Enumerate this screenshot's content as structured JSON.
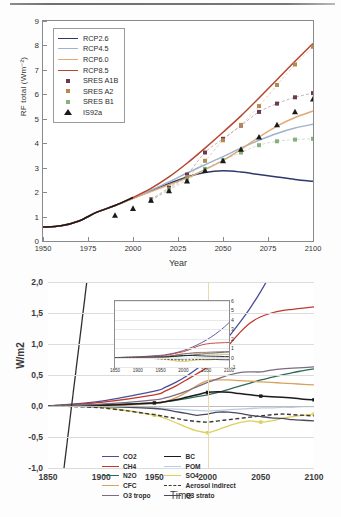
{
  "figure_top": {
    "ylabel": "RF total (Wm⁻²)",
    "xlabel": "Year",
    "yticks": [
      "0",
      "1",
      "2",
      "3",
      "4",
      "5",
      "6",
      "7",
      "8",
      "9"
    ],
    "xticks": [
      "1950",
      "1975",
      "2000",
      "2025",
      "2050",
      "2075",
      "2100"
    ],
    "legend": [
      {
        "label": "RCP2.6",
        "color": "#2b3a6b",
        "type": "line"
      },
      {
        "label": "RCP4.5",
        "color": "#9fb4cc",
        "type": "line"
      },
      {
        "label": "RCP6.0",
        "color": "#e2a878",
        "type": "line"
      },
      {
        "label": "RCP8.5",
        "color": "#b4462f",
        "type": "line"
      },
      {
        "label": "SRES A1B",
        "color": "#6b3a4e",
        "type": "square"
      },
      {
        "label": "SRES A2",
        "color": "#b58a4f",
        "type": "square"
      },
      {
        "label": "SRES B1",
        "color": "#86b07e",
        "type": "square"
      },
      {
        "label": "IS92a",
        "color": "#1a1a1a",
        "type": "triangle"
      }
    ]
  },
  "figure_bottom": {
    "ylabel": "W/m2",
    "xlabel": "Time",
    "yticks": [
      "2,0",
      "1,5",
      "1,0",
      "0,5",
      "0,0",
      "-0,5",
      "-1,0"
    ],
    "xticks": [
      "1850",
      "1900",
      "1950",
      "2000",
      "2050",
      "2100"
    ],
    "inset": {
      "yticks": [
        "6",
        "5",
        "4",
        "3",
        "2",
        "1",
        "0",
        "-1"
      ],
      "xticks": [
        "1850",
        "1900",
        "1950",
        "2000",
        "2050",
        "2100"
      ]
    },
    "legend_left": [
      {
        "label": "CO2",
        "color": "#4a4f9a",
        "style": "solid"
      },
      {
        "label": "CH4",
        "color": "#c0392b",
        "style": "solid"
      },
      {
        "label": "N2O",
        "color": "#2f6b53",
        "style": "solid"
      },
      {
        "label": "CFC",
        "color": "#d9a15f",
        "style": "solid"
      },
      {
        "label": "O3 tropo",
        "color": "#7d6b85",
        "style": "solid"
      }
    ],
    "legend_right": [
      {
        "label": "BC",
        "color": "#1a1a1a",
        "style": "solid-marker"
      },
      {
        "label": "POM",
        "color": "#b9cde2",
        "style": "solid"
      },
      {
        "label": "SO4",
        "color": "#ddd05a",
        "style": "solid-marker"
      },
      {
        "label": "Aerosol indirect",
        "color": "#3a3a3a",
        "style": "dashed"
      },
      {
        "label": "O3 strato",
        "color": "#4a4a5e",
        "style": "solid"
      }
    ]
  },
  "chart_data": [
    {
      "type": "line",
      "id": "rf-total-scenarios",
      "title": "",
      "xlabel": "Year",
      "ylabel": "RF total (Wm-2)",
      "xlim": [
        1950,
        2100
      ],
      "ylim": [
        0,
        9
      ],
      "grid": false,
      "legend_position": "upper-left",
      "x": [
        1950,
        1960,
        1970,
        1980,
        1990,
        2000,
        2010,
        2020,
        2030,
        2040,
        2050,
        2060,
        2070,
        2080,
        2090,
        2100
      ],
      "series": [
        {
          "name": "RCP2.6",
          "color": "#2b3a6b",
          "values": [
            0.57,
            0.62,
            0.82,
            1.18,
            1.45,
            1.75,
            2.05,
            2.35,
            2.62,
            2.8,
            2.87,
            2.82,
            2.72,
            2.62,
            2.52,
            2.44
          ]
        },
        {
          "name": "RCP4.5",
          "color": "#9fb4cc",
          "values": [
            0.57,
            0.62,
            0.82,
            1.18,
            1.45,
            1.75,
            2.08,
            2.42,
            2.78,
            3.12,
            3.45,
            3.8,
            4.12,
            4.4,
            4.62,
            4.78
          ]
        },
        {
          "name": "RCP6.0",
          "color": "#e2a878",
          "values": [
            0.57,
            0.62,
            0.82,
            1.18,
            1.45,
            1.75,
            2.02,
            2.3,
            2.58,
            2.92,
            3.3,
            3.75,
            4.25,
            4.7,
            5.05,
            5.32
          ]
        },
        {
          "name": "RCP8.5",
          "color": "#b4462f",
          "values": [
            0.57,
            0.62,
            0.82,
            1.18,
            1.45,
            1.78,
            2.15,
            2.62,
            3.18,
            3.8,
            4.45,
            5.12,
            5.85,
            6.6,
            7.35,
            8.08
          ]
        }
      ],
      "scatter_series": [
        {
          "name": "SRES A1B",
          "color": "#6b3a4e",
          "marker": "square",
          "x": [
            2010,
            2020,
            2030,
            2040,
            2050,
            2060,
            2070,
            2080,
            2090,
            2100
          ],
          "y": [
            1.7,
            2.18,
            2.72,
            3.62,
            4.18,
            4.72,
            5.28,
            5.62,
            5.88,
            6.05
          ]
        },
        {
          "name": "SRES A2",
          "color": "#b58a4f",
          "marker": "square",
          "x": [
            2010,
            2020,
            2030,
            2040,
            2050,
            2060,
            2070,
            2080,
            2090,
            2100
          ],
          "y": [
            1.66,
            2.12,
            2.62,
            3.28,
            4.12,
            4.75,
            5.52,
            6.38,
            7.22,
            7.95
          ]
        },
        {
          "name": "SRES B1",
          "color": "#86b07e",
          "marker": "square",
          "x": [
            2010,
            2020,
            2030,
            2040,
            2050,
            2060,
            2070,
            2080,
            2090,
            2100
          ],
          "y": [
            1.66,
            2.08,
            2.5,
            2.95,
            3.3,
            3.62,
            3.92,
            4.08,
            4.15,
            4.18
          ]
        },
        {
          "name": "IS92a",
          "color": "#1a1a1a",
          "marker": "triangle",
          "x": [
            1990,
            2000,
            2010,
            2020,
            2030,
            2040,
            2050,
            2060,
            2070,
            2080,
            2090,
            2100
          ],
          "y": [
            1.05,
            1.33,
            1.66,
            2.05,
            2.45,
            2.88,
            3.28,
            3.75,
            4.25,
            4.75,
            5.28,
            5.8
          ]
        }
      ]
    },
    {
      "type": "line",
      "id": "rf-by-agent",
      "title": "",
      "xlabel": "Time",
      "ylabel": "W/m2",
      "xlim": [
        1850,
        2100
      ],
      "ylim": [
        -1.0,
        2.0
      ],
      "grid": true,
      "legend_position": "lower-left",
      "x": [
        1850,
        1900,
        1950,
        1960,
        1970,
        1980,
        1990,
        2000,
        2010,
        2020,
        2030,
        2040,
        2050,
        2060,
        2070,
        2080,
        2090,
        2100
      ],
      "series": [
        {
          "name": "CO2",
          "color": "#4a4f9a",
          "values": [
            0.0,
            0.08,
            0.24,
            0.3,
            0.38,
            0.48,
            0.6,
            0.74,
            0.92,
            1.12,
            1.34,
            1.58,
            1.85,
            2.15,
            2.48,
            2.85,
            3.25,
            3.7
          ]
        },
        {
          "name": "CH4",
          "color": "#c0392b",
          "values": [
            0.0,
            0.06,
            0.18,
            0.24,
            0.32,
            0.42,
            0.52,
            0.63,
            0.78,
            0.98,
            1.18,
            1.34,
            1.44,
            1.5,
            1.54,
            1.56,
            1.58,
            1.6
          ]
        },
        {
          "name": "N2O",
          "color": "#2f6b53",
          "values": [
            0.0,
            0.02,
            0.05,
            0.07,
            0.09,
            0.12,
            0.15,
            0.18,
            0.22,
            0.27,
            0.32,
            0.37,
            0.42,
            0.46,
            0.5,
            0.54,
            0.57,
            0.6
          ]
        },
        {
          "name": "CFC",
          "color": "#d9a15f",
          "values": [
            0.0,
            0.0,
            0.04,
            0.07,
            0.13,
            0.22,
            0.33,
            0.41,
            0.42,
            0.42,
            0.41,
            0.4,
            0.39,
            0.38,
            0.37,
            0.36,
            0.35,
            0.34
          ]
        },
        {
          "name": "O3 tropo",
          "color": "#7d6b85",
          "values": [
            0.0,
            0.03,
            0.1,
            0.13,
            0.18,
            0.24,
            0.31,
            0.38,
            0.44,
            0.5,
            0.54,
            0.55,
            0.55,
            0.58,
            0.6,
            0.61,
            0.62,
            0.63
          ]
        },
        {
          "name": "BC",
          "color": "#1a1a1a",
          "values": [
            0.0,
            0.01,
            0.05,
            0.07,
            0.1,
            0.14,
            0.18,
            0.22,
            0.23,
            0.22,
            0.2,
            0.18,
            0.16,
            0.15,
            0.14,
            0.13,
            0.11,
            0.1
          ]
        },
        {
          "name": "POM",
          "color": "#b9cde2",
          "values": [
            0.0,
            -0.01,
            -0.03,
            -0.04,
            -0.05,
            -0.06,
            -0.07,
            -0.08,
            -0.07,
            -0.06,
            -0.05,
            -0.04,
            -0.03,
            -0.03,
            -0.02,
            -0.02,
            -0.01,
            -0.01
          ]
        },
        {
          "name": "SO4",
          "color": "#ddd05a",
          "values": [
            0.0,
            -0.02,
            -0.15,
            -0.2,
            -0.27,
            -0.34,
            -0.4,
            -0.43,
            -0.38,
            -0.32,
            -0.27,
            -0.24,
            -0.26,
            -0.24,
            -0.2,
            -0.17,
            -0.15,
            -0.13
          ]
        },
        {
          "name": "Aerosol indirect",
          "color": "#3a3a3a",
          "values": [
            0.0,
            -0.03,
            -0.14,
            -0.17,
            -0.2,
            -0.23,
            -0.25,
            -0.26,
            -0.24,
            -0.22,
            -0.2,
            -0.18,
            -0.16,
            -0.14,
            -0.13,
            -0.14,
            -0.15,
            -0.16
          ]
        },
        {
          "name": "O3 strato",
          "color": "#4a4a5e",
          "values": [
            0.0,
            -0.01,
            -0.04,
            -0.06,
            -0.09,
            -0.12,
            -0.15,
            -0.13,
            -0.1,
            -0.1,
            -0.12,
            -0.15,
            -0.17,
            -0.19,
            -0.2,
            -0.22,
            -0.23,
            -0.24
          ]
        }
      ]
    }
  ]
}
